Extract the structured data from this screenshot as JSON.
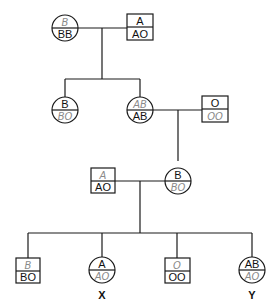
{
  "diagram": {
    "type": "pedigree",
    "generation1": {
      "mother": {
        "shape": "circle",
        "phenotype": "B",
        "genotype": "BB",
        "phenotype_handwritten": true
      },
      "father": {
        "shape": "square",
        "phenotype": "A",
        "genotype": "AO"
      }
    },
    "generation2": {
      "daughter1": {
        "shape": "circle",
        "phenotype": "B",
        "genotype": "BO",
        "genotype_handwritten": true
      },
      "daughter2": {
        "shape": "circle",
        "phenotype": "AB",
        "genotype": "AB",
        "phenotype_handwritten": true
      },
      "spouse": {
        "shape": "square",
        "phenotype": "O",
        "genotype": "OO",
        "genotype_handwritten": true
      }
    },
    "generation3": {
      "spouse": {
        "shape": "square",
        "phenotype": "A",
        "genotype": "AO",
        "phenotype_handwritten": true
      },
      "daughter": {
        "shape": "circle",
        "phenotype": "B",
        "genotype": "BO",
        "genotype_handwritten": true
      }
    },
    "generation4": [
      {
        "shape": "square",
        "phenotype": "B",
        "genotype": "BO",
        "phenotype_handwritten": true,
        "label": ""
      },
      {
        "shape": "circle",
        "phenotype": "A",
        "genotype": "AO",
        "genotype_handwritten": true,
        "label": "X"
      },
      {
        "shape": "square",
        "phenotype": "O",
        "genotype": "OO",
        "phenotype_handwritten": true,
        "label": ""
      },
      {
        "shape": "circle",
        "phenotype": "AB",
        "genotype": "AO",
        "genotype_handwritten": true,
        "label": "Y"
      }
    ]
  }
}
